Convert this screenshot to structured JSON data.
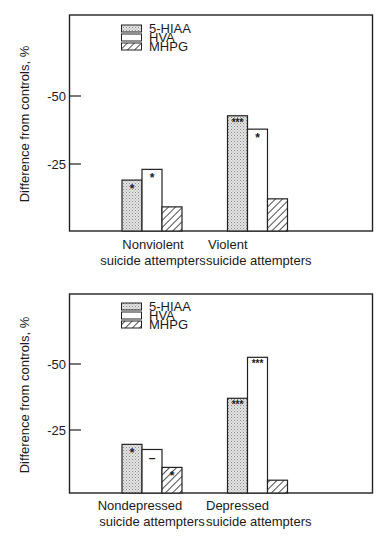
{
  "colors": {
    "ink": "#222222",
    "stipple_fill": "#d9d9d9",
    "background": "#ffffff"
  },
  "chart_data": [
    {
      "type": "bar",
      "title": "",
      "xlabel": "",
      "ylabel": "Difference from controls, %",
      "yticks": [
        "-50",
        "-25"
      ],
      "ylim": [
        0,
        -62
      ],
      "grid": false,
      "legend_position": "top-left inside",
      "legend": [
        "5-HIAA",
        "HVA",
        "MHPG"
      ],
      "categories": [
        "Nonviolent suicide attempters",
        "Violent suicide attempters"
      ],
      "category_lines": [
        [
          "Nonviolent",
          "suicide attempters"
        ],
        [
          "Violent",
          "suicide attempters"
        ]
      ],
      "series": [
        {
          "name": "5-HIAA",
          "pattern": "stippled",
          "values": [
            -19,
            -43
          ],
          "annotations": [
            "*",
            "***"
          ]
        },
        {
          "name": "HVA",
          "pattern": "open",
          "values": [
            -23,
            -38
          ],
          "annotations": [
            "*",
            "*"
          ]
        },
        {
          "name": "MHPG",
          "pattern": "hatched",
          "values": [
            -9,
            -12
          ],
          "annotations": [
            "",
            ""
          ]
        }
      ]
    },
    {
      "type": "bar",
      "title": "",
      "xlabel": "",
      "ylabel": "Difference from controls, %",
      "yticks": [
        "-50",
        "-25"
      ],
      "ylim": [
        0,
        -62
      ],
      "grid": false,
      "legend_position": "top-left inside",
      "legend": [
        "5-HIAA",
        "HVA",
        "MHPG"
      ],
      "categories": [
        "Nondepressed suicide attempters",
        "Depressed suicide attempters"
      ],
      "category_lines": [
        [
          "Nondepressed",
          "suicide attempters"
        ],
        [
          "Depressed",
          "suicide attempters"
        ]
      ],
      "series": [
        {
          "name": "5-HIAA",
          "pattern": "stippled",
          "values": [
            -19,
            -37
          ],
          "annotations": [
            "*",
            "***"
          ]
        },
        {
          "name": "HVA",
          "pattern": "open",
          "values": [
            -17,
            -53
          ],
          "annotations": [
            "–",
            "***"
          ]
        },
        {
          "name": "MHPG",
          "pattern": "hatched",
          "values": [
            -10,
            -5
          ],
          "annotations": [
            "*",
            ""
          ]
        }
      ]
    }
  ]
}
